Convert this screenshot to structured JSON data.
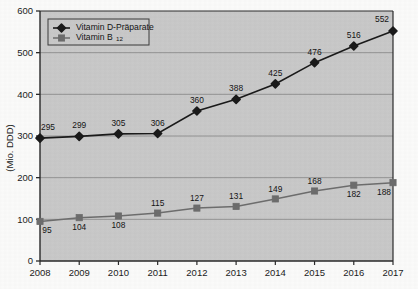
{
  "chart_data": {
    "type": "line",
    "title": "",
    "xlabel": "",
    "ylabel": "(Mio. DDD)",
    "categories": [
      "2008",
      "2009",
      "2010",
      "2011",
      "2012",
      "2013",
      "2014",
      "2015",
      "2016",
      "2017"
    ],
    "ylim": [
      0,
      600
    ],
    "yticks": [
      0,
      100,
      200,
      300,
      400,
      500,
      600
    ],
    "ytick_labels": [
      "0",
      "100",
      "200",
      "300",
      "400",
      "500",
      "600"
    ],
    "grid": true,
    "legend_position": "top-left",
    "series": [
      {
        "name": "Vitamin D-Präparate",
        "marker": "diamond",
        "color": "#1a1a1a",
        "values": [
          295,
          299,
          305,
          306,
          360,
          388,
          425,
          476,
          516,
          552
        ],
        "labels": [
          "295",
          "299",
          "305",
          "306",
          "360",
          "388",
          "425",
          "476",
          "516",
          "552"
        ]
      },
      {
        "name": "Vitamin B12",
        "name_base": "Vitamin B",
        "name_sub": "12",
        "marker": "square",
        "color": "#6d6d6d",
        "values": [
          95,
          104,
          108,
          115,
          127,
          131,
          149,
          168,
          182,
          188
        ],
        "labels": [
          "95",
          "104",
          "108",
          "115",
          "127",
          "131",
          "149",
          "168",
          "182",
          "188"
        ]
      }
    ]
  },
  "colors": {
    "plot_background": "#c9c9c9",
    "page_background": "#fbfbfa",
    "gridline": "#8d8d8d",
    "axis": "#2a2a2a",
    "series_d": "#1a1a1a",
    "series_b12": "#6d6d6d",
    "legend_background": "#c9c9c9",
    "legend_border": "#3a3a3a"
  }
}
